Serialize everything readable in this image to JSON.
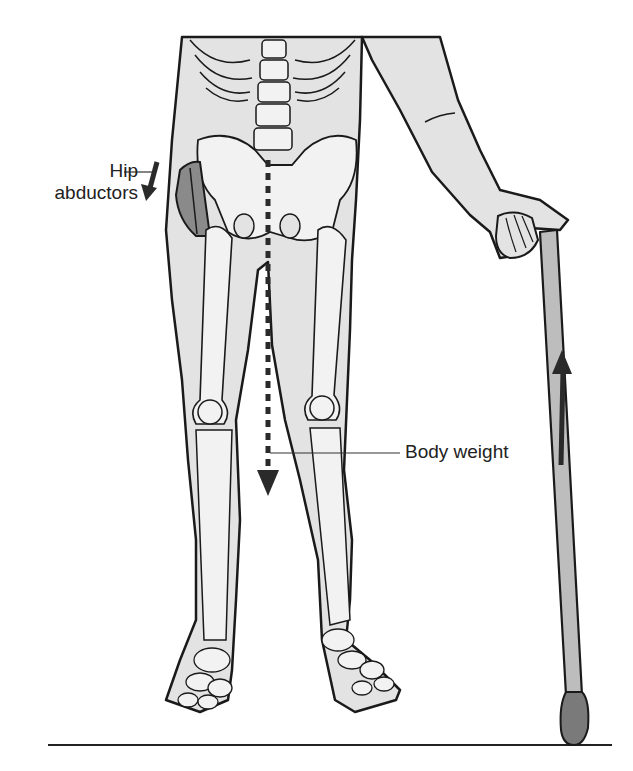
{
  "figure": {
    "labels": {
      "hip_abductors_line1": "Hip",
      "hip_abductors_line2": "abductors",
      "body_weight": "Body weight"
    },
    "colors": {
      "skin": "#e3e3e3",
      "bone": "#f2f2f2",
      "outline": "#1a1a1a",
      "muscle": "#8a8a8a",
      "cane": "#bdbdbd",
      "cane_tip": "#7a7a7a",
      "arrow": "#2a2a2a"
    }
  }
}
